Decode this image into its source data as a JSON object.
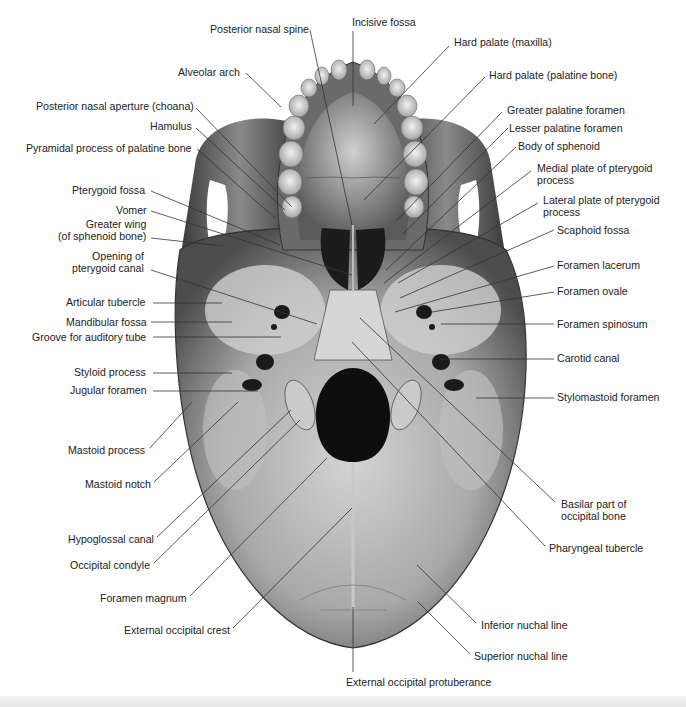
{
  "figure": {
    "colors": {
      "bone_light": "#d9d9d9",
      "bone_mid": "#9a9a9a",
      "bone_dark": "#4a4a4a",
      "hole": "#141414",
      "leader": "#333333",
      "text": "#222222"
    }
  },
  "labels": {
    "left": [
      {
        "id": "posterior-nasal-spine",
        "text": "Posterior nasal spine",
        "x": 210,
        "y": 23,
        "align": "l",
        "lx1": 310,
        "ly1": 30,
        "lx2": 352,
        "ly2": 225
      },
      {
        "id": "alveolar-arch",
        "text": "Alveolar arch",
        "x": 178,
        "y": 66,
        "align": "l",
        "lx1": 246,
        "ly1": 73,
        "lx2": 281,
        "ly2": 107
      },
      {
        "id": "posterior-nasal-aperture",
        "text": "Posterior nasal aperture (choana)",
        "x": 36,
        "y": 100,
        "align": "l",
        "lx1": 196,
        "ly1": 108,
        "lx2": 292,
        "ly2": 207
      },
      {
        "id": "hamulus",
        "text": "Hamulus",
        "x": 150,
        "y": 120,
        "align": "l",
        "lx1": 196,
        "ly1": 128,
        "lx2": 285,
        "ly2": 210
      },
      {
        "id": "pyramidal-process",
        "text": "Pyramidal process of palatine bone",
        "x": 26,
        "y": 142,
        "align": "l",
        "lx1": 197,
        "ly1": 149,
        "lx2": 275,
        "ly2": 218
      },
      {
        "id": "pterygoid-fossa",
        "text": "Pterygoid fossa",
        "x": 72,
        "y": 184,
        "align": "l",
        "lx1": 151,
        "ly1": 191,
        "lx2": 280,
        "ly2": 245
      },
      {
        "id": "vomer",
        "text": "Vomer",
        "x": 116,
        "y": 204,
        "align": "l",
        "lx1": 151,
        "ly1": 211,
        "lx2": 352,
        "ly2": 275
      },
      {
        "id": "greater-wing",
        "text": "Greater wing\n(of sphenoid bone)",
        "x": 58,
        "y": 218,
        "align": "r",
        "lx1": 151,
        "ly1": 238,
        "lx2": 223,
        "ly2": 246
      },
      {
        "id": "opening-pterygoid-canal",
        "text": "Opening of\npterygoid canal",
        "x": 72,
        "y": 250,
        "align": "r",
        "lx1": 151,
        "ly1": 270,
        "lx2": 317,
        "ly2": 324
      },
      {
        "id": "articular-tubercle",
        "text": "Articular tubercle",
        "x": 66,
        "y": 296,
        "align": "l",
        "lx1": 153,
        "ly1": 303,
        "lx2": 222,
        "ly2": 303
      },
      {
        "id": "mandibular-fossa",
        "text": "Mandibular fossa",
        "x": 66,
        "y": 316,
        "align": "l",
        "lx1": 151,
        "ly1": 322,
        "lx2": 232,
        "ly2": 322
      },
      {
        "id": "groove-auditory-tube",
        "text": "Groove for auditory tube",
        "x": 32,
        "y": 331,
        "align": "l",
        "lx1": 153,
        "ly1": 337,
        "lx2": 281,
        "ly2": 337
      },
      {
        "id": "styloid-process",
        "text": "Styloid process",
        "x": 74,
        "y": 366,
        "align": "l",
        "lx1": 153,
        "ly1": 373,
        "lx2": 232,
        "ly2": 373
      },
      {
        "id": "jugular-foramen",
        "text": "Jugular foramen",
        "x": 70,
        "y": 384,
        "align": "l",
        "lx1": 153,
        "ly1": 391,
        "lx2": 258,
        "ly2": 391
      },
      {
        "id": "mastoid-process",
        "text": "Mastoid process",
        "x": 68,
        "y": 444,
        "align": "l",
        "lx1": 150,
        "ly1": 448,
        "lx2": 192,
        "ly2": 402
      },
      {
        "id": "mastoid-notch",
        "text": "Mastoid notch",
        "x": 85,
        "y": 478,
        "align": "l",
        "lx1": 154,
        "ly1": 482,
        "lx2": 238,
        "ly2": 402
      },
      {
        "id": "hypoglossal-canal",
        "text": "Hypoglossal canal",
        "x": 68,
        "y": 533,
        "align": "l",
        "lx1": 157,
        "ly1": 537,
        "lx2": 291,
        "ly2": 410
      },
      {
        "id": "occipital-condyle",
        "text": "Occipital condyle",
        "x": 70,
        "y": 559,
        "align": "l",
        "lx1": 154,
        "ly1": 563,
        "lx2": 300,
        "ly2": 420
      },
      {
        "id": "foramen-magnum",
        "text": "Foramen magnum",
        "x": 100,
        "y": 592,
        "align": "l",
        "lx1": 190,
        "ly1": 596,
        "lx2": 327,
        "ly2": 458
      },
      {
        "id": "external-occipital-crest",
        "text": "External occipital crest",
        "x": 124,
        "y": 624,
        "align": "l",
        "lx1": 233,
        "ly1": 628,
        "lx2": 352,
        "ly2": 508
      }
    ],
    "right": [
      {
        "id": "incisive-fossa",
        "text": "Incisive fossa",
        "x": 352,
        "y": 16,
        "align": "l",
        "lx1": 353,
        "ly1": 31,
        "lx2": 353,
        "ly2": 106
      },
      {
        "id": "hard-palate-maxilla",
        "text": "Hard palate (maxilla)",
        "x": 454,
        "y": 36,
        "align": "l",
        "lx1": 449,
        "ly1": 46,
        "lx2": 374,
        "ly2": 124
      },
      {
        "id": "hard-palate-palatine",
        "text": "Hard palate (palatine bone)",
        "x": 489,
        "y": 69,
        "align": "l",
        "lx1": 485,
        "ly1": 77,
        "lx2": 364,
        "ly2": 200
      },
      {
        "id": "greater-palatine-foramen",
        "text": "Greater palatine foramen",
        "x": 507,
        "y": 104,
        "align": "l",
        "lx1": 502,
        "ly1": 112,
        "lx2": 397,
        "ly2": 220
      },
      {
        "id": "lesser-palatine-foramen",
        "text": "Lesser palatine foramen",
        "x": 509,
        "y": 122,
        "align": "l",
        "lx1": 508,
        "ly1": 128,
        "lx2": 403,
        "ly2": 234
      },
      {
        "id": "body-of-sphenoid",
        "text": "Body of sphenoid",
        "x": 518,
        "y": 140,
        "align": "l",
        "lx1": 516,
        "ly1": 147,
        "lx2": 386,
        "ly2": 270
      },
      {
        "id": "medial-plate",
        "text": "Medial plate of pterygoid\nprocess",
        "x": 537,
        "y": 162,
        "align": "l",
        "lx1": 531,
        "ly1": 171,
        "lx2": 384,
        "ly2": 283
      },
      {
        "id": "lateral-plate",
        "text": "Lateral plate of pterygoid\nprocess",
        "x": 543,
        "y": 194,
        "align": "l",
        "lx1": 538,
        "ly1": 203,
        "lx2": 398,
        "ly2": 283
      },
      {
        "id": "scaphoid-fossa",
        "text": "Scaphoid fossa",
        "x": 557,
        "y": 224,
        "align": "l",
        "lx1": 554,
        "ly1": 230,
        "lx2": 400,
        "ly2": 298
      },
      {
        "id": "foramen-lacerum",
        "text": "Foramen lacerum",
        "x": 557,
        "y": 259,
        "align": "l",
        "lx1": 554,
        "ly1": 266,
        "lx2": 395,
        "ly2": 312
      },
      {
        "id": "foramen-ovale",
        "text": "Foramen ovale",
        "x": 557,
        "y": 285,
        "align": "l",
        "lx1": 554,
        "ly1": 292,
        "lx2": 432,
        "ly2": 312
      },
      {
        "id": "foramen-spinosum",
        "text": "Foramen spinosum",
        "x": 557,
        "y": 318,
        "align": "l",
        "lx1": 554,
        "ly1": 324,
        "lx2": 441,
        "ly2": 324
      },
      {
        "id": "carotid-canal",
        "text": "Carotid canal",
        "x": 557,
        "y": 352,
        "align": "l",
        "lx1": 554,
        "ly1": 359,
        "lx2": 440,
        "ly2": 359
      },
      {
        "id": "stylomastoid-foramen",
        "text": "Stylomastoid foramen",
        "x": 557,
        "y": 391,
        "align": "l",
        "lx1": 554,
        "ly1": 398,
        "lx2": 476,
        "ly2": 398
      },
      {
        "id": "basilar-part",
        "text": "Basilar part of\noccipital bone",
        "x": 561,
        "y": 498,
        "align": "l",
        "lx1": 555,
        "ly1": 502,
        "lx2": 360,
        "ly2": 318
      },
      {
        "id": "pharyngeal-tubercle",
        "text": "Pharyngeal tubercle",
        "x": 549,
        "y": 542,
        "align": "l",
        "lx1": 545,
        "ly1": 546,
        "lx2": 352,
        "ly2": 342
      },
      {
        "id": "inferior-nuchal-line",
        "text": "Inferior nuchal line",
        "x": 481,
        "y": 619,
        "align": "l",
        "lx1": 476,
        "ly1": 623,
        "lx2": 417,
        "ly2": 565
      },
      {
        "id": "superior-nuchal-line",
        "text": "Superior nuchal line",
        "x": 474,
        "y": 650,
        "align": "l",
        "lx1": 470,
        "ly1": 654,
        "lx2": 418,
        "ly2": 602
      },
      {
        "id": "external-occipital-protuberance",
        "text": "External occipital protuberance",
        "x": 346,
        "y": 676,
        "align": "l",
        "lx1": 353,
        "ly1": 672,
        "lx2": 353,
        "ly2": 607
      }
    ]
  }
}
